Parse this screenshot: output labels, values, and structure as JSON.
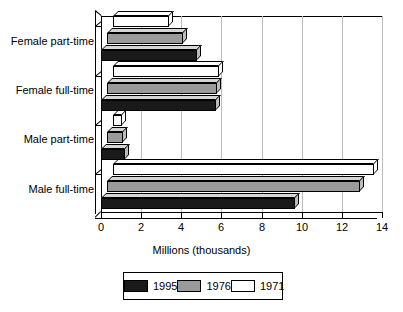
{
  "chart_data": {
    "type": "bar",
    "orientation": "horizontal",
    "title": "",
    "xlabel": "Millions (thousands)",
    "ylabel": "",
    "xlim": [
      0,
      14
    ],
    "xticks": [
      0,
      2,
      4,
      6,
      8,
      10,
      12,
      14
    ],
    "grid": true,
    "legend_position": "bottom",
    "categories": [
      "Male full-time",
      "Male part-time",
      "Female full-time",
      "Female part-time"
    ],
    "series": [
      {
        "name": "1995",
        "color": "#1a1a1a",
        "values": [
          9.65,
          1.2,
          5.75,
          4.8
        ]
      },
      {
        "name": "1976",
        "color": "#9a9a9a",
        "values": [
          12.6,
          0.8,
          5.5,
          3.8
        ]
      },
      {
        "name": "1971",
        "color": "#ffffff",
        "values": [
          13.0,
          0.45,
          5.3,
          2.8
        ]
      }
    ]
  },
  "axis": {
    "x_title": "Millions (thousands)",
    "x_tick_labels": [
      "0",
      "2",
      "4",
      "6",
      "8",
      "10",
      "12",
      "14"
    ],
    "y_tick_labels": [
      "Female part-time",
      "Female full-time",
      "Male part-time",
      "Male full-time"
    ]
  },
  "legend": {
    "items": [
      {
        "label": "1995",
        "color": "#1a1a1a"
      },
      {
        "label": "1976",
        "color": "#9a9a9a"
      },
      {
        "label": "1971",
        "color": "#ffffff"
      }
    ]
  },
  "colors": {
    "axis": "#000000",
    "grid": "#bdbdbd",
    "background": "#ffffff",
    "series_1995": "#1a1a1a",
    "series_1976": "#9a9a9a",
    "series_1971": "#ffffff"
  }
}
